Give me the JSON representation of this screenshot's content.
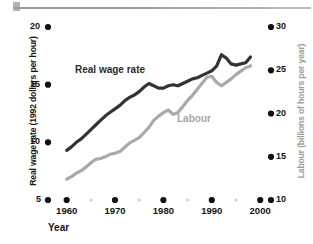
{
  "chart_data": {
    "type": "line",
    "title": "",
    "xlabel": "Year",
    "x": [
      1960,
      1961,
      1962,
      1963,
      1964,
      1965,
      1966,
      1967,
      1968,
      1969,
      1970,
      1971,
      1972,
      1973,
      1974,
      1975,
      1976,
      1977,
      1978,
      1979,
      1980,
      1981,
      1982,
      1983,
      1984,
      1985,
      1986,
      1987,
      1988,
      1989,
      1990,
      1991,
      1992,
      1993,
      1994,
      1995,
      1996,
      1997,
      1998
    ],
    "xlim": [
      1958,
      2001
    ],
    "xticks": [
      1960,
      1970,
      1980,
      1990,
      2000
    ],
    "xtick_labels": [
      "1960",
      "1970",
      "1980",
      "1990",
      "2000"
    ],
    "xminor_ticks": [
      1965,
      1975,
      1985,
      1995
    ],
    "grid": false,
    "legend_position": "inline-labels",
    "series": [
      {
        "name": "Real wage rate",
        "color": "#333333",
        "axis": "left",
        "ylabel": "Real wage rate (1992 dollars per hour)",
        "ylim": [
          5,
          20.5
        ],
        "yticks": [
          5,
          10,
          15,
          20
        ],
        "ytick_labels": [
          "5",
          "10",
          "15",
          "20"
        ],
        "units": "1992 dollars per hour",
        "values": [
          9.3,
          9.6,
          10.0,
          10.3,
          10.7,
          11.1,
          11.5,
          11.9,
          12.3,
          12.6,
          12.9,
          13.2,
          13.6,
          13.9,
          14.1,
          14.4,
          14.8,
          15.1,
          14.9,
          14.7,
          14.7,
          14.9,
          15.0,
          14.9,
          15.1,
          15.3,
          15.5,
          15.6,
          15.8,
          16.0,
          16.2,
          16.6,
          17.6,
          17.3,
          16.8,
          16.7,
          16.8,
          16.9,
          17.4
        ]
      },
      {
        "name": "Labour",
        "color": "#a9a9a9",
        "axis": "right",
        "ylabel": "Labour (billions of hours per year)",
        "ylim": [
          10,
          31.5
        ],
        "yticks": [
          10,
          15,
          20,
          25,
          30
        ],
        "ytick_labels": [
          "10",
          "15",
          "20",
          "25",
          "30"
        ],
        "units": "billions of hours per year",
        "values": [
          12.4,
          12.7,
          13.1,
          13.4,
          13.8,
          14.3,
          14.7,
          14.8,
          15.0,
          15.3,
          15.4,
          15.6,
          16.1,
          16.6,
          16.9,
          17.2,
          17.8,
          18.4,
          19.2,
          19.7,
          20.1,
          20.4,
          19.9,
          20.1,
          20.8,
          21.5,
          22.1,
          22.8,
          23.5,
          24.2,
          24.3,
          23.6,
          23.2,
          23.6,
          24.0,
          24.5,
          24.9,
          25.3,
          25.5
        ]
      }
    ]
  },
  "axes": {
    "left": {
      "title": "Real wage rate (1992 dollars per hour)",
      "ticks": [
        {
          "label": "20",
          "value": 20
        },
        {
          "label": "15",
          "value": 15
        },
        {
          "label": "10",
          "value": 10
        },
        {
          "label": "5",
          "value": 5
        }
      ]
    },
    "right": {
      "title": "Labour (billions of hours per year)",
      "ticks": [
        {
          "label": "30",
          "value": 30
        },
        {
          "label": "25",
          "value": 25
        },
        {
          "label": "20",
          "value": 20
        },
        {
          "label": "15",
          "value": 15
        },
        {
          "label": "10",
          "value": 10
        }
      ]
    },
    "bottom": {
      "title": "Year",
      "ticks": [
        {
          "label": "1960",
          "value": 1960
        },
        {
          "label": "1970",
          "value": 1970
        },
        {
          "label": "1980",
          "value": 1980
        },
        {
          "label": "1990",
          "value": 1990
        },
        {
          "label": "2000",
          "value": 2000
        }
      ]
    }
  },
  "series_labels": {
    "wage": "Real wage rate",
    "labour": "Labour"
  },
  "colors": {
    "wage_line": "#333333",
    "labour_line": "#a9a9a9",
    "tick_dot": "#111111",
    "minor_tick_dot": "#cfcfcf",
    "right_axis_title": "#9d9d9d"
  }
}
